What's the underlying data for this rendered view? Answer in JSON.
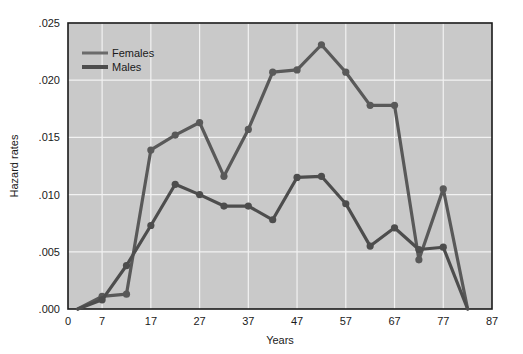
{
  "chart_data": {
    "type": "line",
    "title": "",
    "xlabel": "Years",
    "ylabel": "Hazard rates",
    "xlim": [
      0,
      87
    ],
    "ylim": [
      0.0,
      0.025
    ],
    "xticks": [
      "0",
      "7",
      "17",
      "27",
      "37",
      "47",
      "57",
      "67",
      "77",
      "87"
    ],
    "xtick_values": [
      0,
      7,
      17,
      27,
      37,
      47,
      57,
      67,
      77,
      87
    ],
    "yticks": [
      ".000",
      ".005",
      ".010",
      ".015",
      ".020",
      ".025"
    ],
    "ytick_values": [
      0.0,
      0.005,
      0.01,
      0.015,
      0.02,
      0.025
    ],
    "grid": true,
    "legend_position": "top-left",
    "plot_background": "#c9c9c9",
    "series": [
      {
        "name": "Females",
        "color": "#595959",
        "x": [
          2,
          7,
          12,
          17,
          22,
          27,
          32,
          37,
          42,
          47,
          52,
          57,
          62,
          67,
          72,
          77,
          82
        ],
        "values": [
          0.0,
          0.0011,
          0.0013,
          0.0139,
          0.0152,
          0.0163,
          0.0116,
          0.0157,
          0.0207,
          0.0209,
          0.0231,
          0.0207,
          0.0178,
          0.0178,
          0.0043,
          0.0105,
          0.0
        ]
      },
      {
        "name": "Males",
        "color": "#4d4d4d",
        "x": [
          2,
          7,
          12,
          17,
          22,
          27,
          32,
          37,
          42,
          47,
          52,
          57,
          62,
          67,
          72,
          77,
          82
        ],
        "values": [
          0.0,
          0.0008,
          0.0038,
          0.0073,
          0.0109,
          0.01,
          0.009,
          0.009,
          0.0078,
          0.0115,
          0.0116,
          0.0092,
          0.0055,
          0.0071,
          0.0052,
          0.0054,
          0.0
        ]
      }
    ],
    "legend": [
      {
        "label": "Females",
        "color": "#6b6b6b",
        "line_width": 3
      },
      {
        "label": "Males",
        "color": "#4d4d4d",
        "line_width": 4
      }
    ]
  }
}
